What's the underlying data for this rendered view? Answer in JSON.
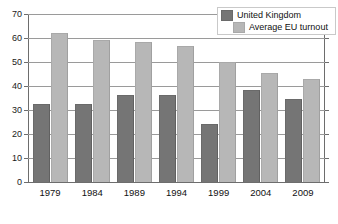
{
  "chart_data": {
    "type": "bar",
    "title": "",
    "subtitle": "",
    "xlabel": "",
    "ylabel": "",
    "categories": [
      "1979",
      "1984",
      "1989",
      "1994",
      "1999",
      "2004",
      "2009"
    ],
    "series": [
      {
        "name": "United Kingdom",
        "color": "#757575",
        "values": [
          32.3,
          32.6,
          36.4,
          36.4,
          24.0,
          38.5,
          34.7
        ]
      },
      {
        "name": "Average EU turnout",
        "color": "#b7b7b7",
        "values": [
          62.0,
          59.0,
          58.5,
          56.8,
          49.8,
          45.5,
          43.0
        ]
      }
    ],
    "ylim": [
      0,
      70
    ],
    "yticks": [
      0,
      10,
      20,
      30,
      40,
      50,
      60,
      70
    ],
    "ytick_labels": [
      "0",
      "10",
      "20",
      "30",
      "40",
      "50",
      "60",
      "70"
    ],
    "grid": true,
    "legend_position": "top-right"
  },
  "legend": {
    "entries": [
      {
        "label": "United Kingdom",
        "swatch": "dark-gray-swatch"
      },
      {
        "label": "Average EU turnout",
        "swatch": "light-gray-swatch"
      }
    ]
  },
  "colors": {
    "series_uk": "#757575",
    "series_eu": "#b7b7b7",
    "gridline": "#9a9a9a",
    "axis": "#6d6d6d",
    "background": "#ffffff",
    "text": "#111111"
  }
}
